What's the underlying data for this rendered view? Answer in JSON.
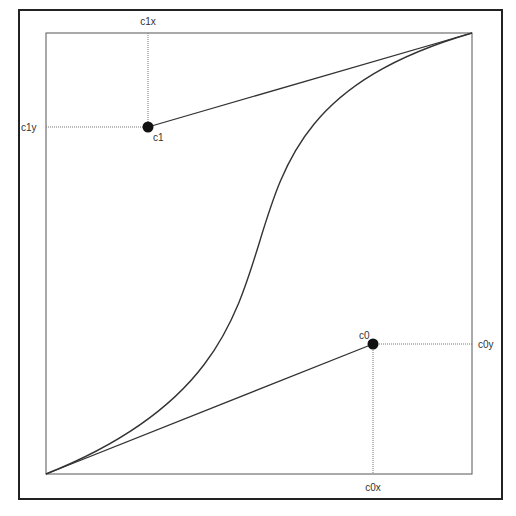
{
  "diagram": {
    "colors": {
      "background": "#ffffff",
      "frame": "#222222",
      "grid_box": "#555555",
      "curve": "#333333",
      "guide": "#777777",
      "point": "#111111"
    },
    "labels": {
      "c1x": "c1x",
      "c1y": "c1y",
      "c1": "c1",
      "c0": "c0",
      "c0x": "c0x",
      "c0y": "c0y"
    },
    "points": {
      "start": {
        "x": 46,
        "y": 474
      },
      "end": {
        "x": 472,
        "y": 33
      },
      "c0": {
        "x": 373,
        "y": 344
      },
      "c1": {
        "x": 148,
        "y": 127
      }
    }
  }
}
